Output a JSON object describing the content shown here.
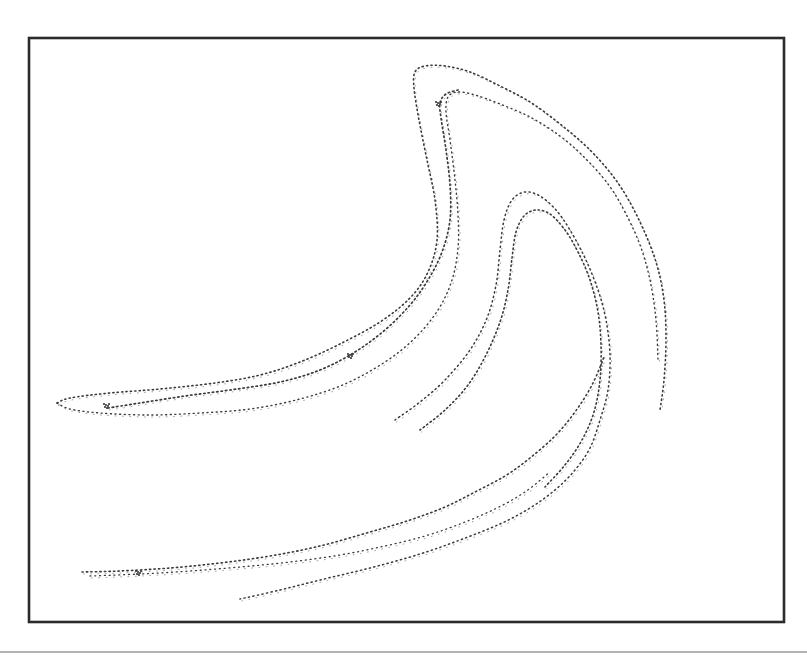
{
  "chart_data": {
    "type": "scatter",
    "title": "",
    "xlabel": "",
    "ylabel": "",
    "grid": false,
    "legend": null,
    "frame": {
      "x": 29,
      "y": 38,
      "width": 755,
      "height": 584
    },
    "separator_y": 652,
    "colors": {
      "points": "#3a3a3a",
      "frame": "#2b2b2b",
      "separator": "#9a9a9a",
      "background": "#ffffff"
    },
    "series": [
      {
        "name": "outer-fold-upper",
        "dash": "1.2 3.2",
        "width": 1.6,
        "points": [
          [
            57,
            403
          ],
          [
            70,
            398
          ],
          [
            110,
            393
          ],
          [
            160,
            389
          ],
          [
            215,
            383
          ],
          [
            260,
            375
          ],
          [
            300,
            362
          ],
          [
            340,
            344
          ],
          [
            380,
            322
          ],
          [
            410,
            298
          ],
          [
            428,
            272
          ],
          [
            437,
            240
          ],
          [
            435,
            200
          ],
          [
            427,
            160
          ],
          [
            419,
            120
          ],
          [
            414,
            88
          ],
          [
            415,
            72
          ],
          [
            425,
            66
          ],
          [
            445,
            66
          ],
          [
            470,
            72
          ],
          [
            500,
            86
          ],
          [
            530,
            102
          ],
          [
            560,
            124
          ],
          [
            590,
            150
          ],
          [
            618,
            183
          ],
          [
            640,
            222
          ],
          [
            656,
            262
          ],
          [
            664,
            300
          ],
          [
            666,
            340
          ],
          [
            664,
            380
          ],
          [
            660,
            410
          ]
        ]
      },
      {
        "name": "outer-fold-lower",
        "dash": "1 3.6",
        "width": 1.4,
        "points": [
          [
            57,
            403
          ],
          [
            70,
            409
          ],
          [
            100,
            413
          ],
          [
            150,
            415
          ],
          [
            200,
            413
          ],
          [
            250,
            409
          ],
          [
            300,
            399
          ],
          [
            345,
            384
          ],
          [
            385,
            362
          ],
          [
            415,
            338
          ],
          [
            438,
            310
          ],
          [
            452,
            280
          ],
          [
            458,
            248
          ],
          [
            458,
            215
          ],
          [
            455,
            180
          ],
          [
            450,
            140
          ],
          [
            446,
            112
          ],
          [
            448,
            97
          ],
          [
            458,
            92
          ],
          [
            475,
            95
          ],
          [
            500,
            104
          ],
          [
            530,
            117
          ],
          [
            560,
            136
          ],
          [
            585,
            158
          ],
          [
            608,
            184
          ],
          [
            625,
            212
          ],
          [
            640,
            245
          ],
          [
            650,
            280
          ],
          [
            656,
            320
          ],
          [
            658,
            360
          ]
        ]
      },
      {
        "name": "inner-fold",
        "dash": "1.4 3",
        "width": 1.7,
        "points": [
          [
            108,
            408
          ],
          [
            140,
            403
          ],
          [
            185,
            396
          ],
          [
            230,
            390
          ],
          [
            280,
            382
          ],
          [
            320,
            370
          ],
          [
            355,
            352
          ],
          [
            385,
            330
          ],
          [
            410,
            305
          ],
          [
            428,
            280
          ],
          [
            442,
            252
          ],
          [
            450,
            220
          ],
          [
            450,
            185
          ],
          [
            446,
            150
          ],
          [
            441,
            118
          ],
          [
            440,
            103
          ],
          [
            446,
            94
          ],
          [
            458,
            90
          ]
        ]
      },
      {
        "name": "middle-arc-outer",
        "dash": "1.2 3.4",
        "width": 1.5,
        "points": [
          [
            395,
            420
          ],
          [
            420,
            402
          ],
          [
            445,
            380
          ],
          [
            470,
            350
          ],
          [
            487,
            318
          ],
          [
            496,
            285
          ],
          [
            500,
            250
          ],
          [
            504,
            220
          ],
          [
            512,
            200
          ],
          [
            525,
            192
          ],
          [
            540,
            196
          ],
          [
            556,
            210
          ],
          [
            570,
            230
          ],
          [
            585,
            258
          ],
          [
            598,
            290
          ],
          [
            606,
            320
          ],
          [
            610,
            355
          ],
          [
            608,
            390
          ],
          [
            600,
            420
          ],
          [
            590,
            448
          ],
          [
            575,
            470
          ],
          [
            555,
            490
          ],
          [
            530,
            508
          ],
          [
            500,
            524
          ],
          [
            460,
            540
          ],
          [
            420,
            554
          ],
          [
            370,
            568
          ],
          [
            320,
            580
          ],
          [
            280,
            590
          ],
          [
            240,
            599
          ]
        ]
      },
      {
        "name": "middle-arc-inner",
        "dash": "1.3 3",
        "width": 1.6,
        "points": [
          [
            420,
            430
          ],
          [
            445,
            410
          ],
          [
            468,
            385
          ],
          [
            486,
            355
          ],
          [
            500,
            322
          ],
          [
            508,
            290
          ],
          [
            512,
            258
          ],
          [
            516,
            232
          ],
          [
            524,
            216
          ],
          [
            536,
            210
          ],
          [
            550,
            214
          ],
          [
            565,
            230
          ],
          [
            578,
            252
          ],
          [
            590,
            280
          ],
          [
            598,
            312
          ],
          [
            601,
            345
          ],
          [
            600,
            380
          ],
          [
            594,
            412
          ],
          [
            582,
            440
          ],
          [
            565,
            465
          ],
          [
            545,
            487
          ]
        ]
      },
      {
        "name": "lower-sweep",
        "dash": "1.3 3.2",
        "width": 1.6,
        "points": [
          [
            82,
            572
          ],
          [
            120,
            571
          ],
          [
            170,
            568
          ],
          [
            220,
            563
          ],
          [
            270,
            556
          ],
          [
            320,
            546
          ],
          [
            370,
            532
          ],
          [
            410,
            520
          ],
          [
            445,
            507
          ],
          [
            475,
            492
          ],
          [
            505,
            476
          ],
          [
            530,
            458
          ],
          [
            555,
            436
          ],
          [
            575,
            412
          ],
          [
            592,
            385
          ],
          [
            605,
            355
          ]
        ]
      },
      {
        "name": "lower-sweep-inner",
        "dash": "1 3.8",
        "width": 1.3,
        "points": [
          [
            90,
            576
          ],
          [
            140,
            574
          ],
          [
            190,
            571
          ],
          [
            240,
            567
          ],
          [
            290,
            562
          ],
          [
            340,
            555
          ],
          [
            385,
            546
          ],
          [
            425,
            536
          ],
          [
            460,
            524
          ],
          [
            495,
            509
          ],
          [
            525,
            492
          ],
          [
            550,
            472
          ]
        ]
      }
    ],
    "clusters": [
      {
        "x": 108,
        "y": 406,
        "label": "dense-knot-left"
      },
      {
        "x": 352,
        "y": 356,
        "label": "dense-knot-mid"
      },
      {
        "x": 140,
        "y": 573,
        "label": "dense-knot-bottom"
      },
      {
        "x": 440,
        "y": 104,
        "label": "dense-hook-top"
      }
    ]
  }
}
